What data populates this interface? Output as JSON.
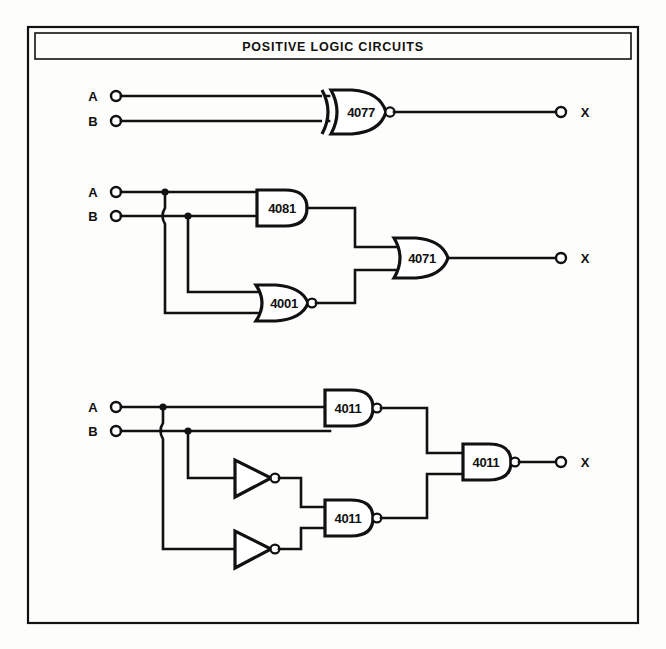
{
  "figure": {
    "title": "POSITIVE LOGIC CIRCUITS",
    "frame": {
      "outer": [
        28,
        27,
        610,
        596
      ],
      "inner_title_box": [
        35,
        33,
        596,
        26
      ]
    },
    "ink_color": "#111111",
    "paper_color": "#fdfdfb"
  },
  "circuits": [
    {
      "id": "circuit-1",
      "name": "xnor-single-gate",
      "inputs": [
        {
          "label": "A",
          "terminal": [
            116,
            96
          ]
        },
        {
          "label": "B",
          "terminal": [
            116,
            121
          ]
        }
      ],
      "outputs": [
        {
          "label": "X",
          "terminal": [
            561,
            112
          ]
        }
      ],
      "gates": [
        {
          "type": "xnor",
          "part": "4077",
          "inverted_output": true,
          "box": [
            322,
            90,
            64,
            44
          ]
        }
      ]
    },
    {
      "id": "circuit-2",
      "name": "and-nor-or-network",
      "inputs": [
        {
          "label": "A",
          "terminal": [
            116,
            192
          ]
        },
        {
          "label": "B",
          "terminal": [
            116,
            216
          ]
        }
      ],
      "outputs": [
        {
          "label": "X",
          "terminal": [
            561,
            258
          ]
        }
      ],
      "gates": [
        {
          "type": "and",
          "part": "4081",
          "inverted_output": false,
          "box": [
            257,
            190,
            50,
            36
          ]
        },
        {
          "type": "nor",
          "part": "4001",
          "inverted_output": true,
          "box": [
            257,
            285,
            50,
            36
          ]
        },
        {
          "type": "or",
          "part": "4071",
          "inverted_output": false,
          "box": [
            396,
            238,
            50,
            40
          ]
        }
      ]
    },
    {
      "id": "circuit-3",
      "name": "nand-inverter-network",
      "inputs": [
        {
          "label": "A",
          "terminal": [
            116,
            407
          ]
        },
        {
          "label": "B",
          "terminal": [
            116,
            431
          ]
        }
      ],
      "outputs": [
        {
          "label": "X",
          "terminal": [
            561,
            462
          ]
        }
      ],
      "gates": [
        {
          "type": "nand",
          "part": "4011",
          "inverted_output": true,
          "box": [
            325,
            390,
            48,
            36
          ]
        },
        {
          "type": "nand",
          "part": "4011",
          "inverted_output": true,
          "box": [
            325,
            500,
            48,
            36
          ]
        },
        {
          "type": "nand",
          "part": "4011",
          "inverted_output": true,
          "box": [
            463,
            444,
            48,
            36
          ]
        },
        {
          "type": "inverter",
          "part": "",
          "inverted_output": true,
          "box": [
            233,
            460,
            42,
            38
          ]
        },
        {
          "type": "inverter",
          "part": "",
          "inverted_output": true,
          "box": [
            233,
            531,
            42,
            38
          ]
        }
      ]
    }
  ],
  "labels": {
    "input_a": "A",
    "input_b": "B",
    "output_x": "X",
    "part_4077": "4077",
    "part_4081": "4081",
    "part_4001": "4001",
    "part_4071": "4071",
    "part_4011": "4011"
  }
}
